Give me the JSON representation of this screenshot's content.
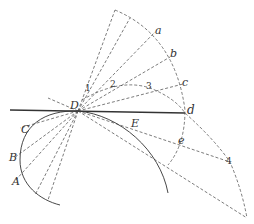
{
  "diagram": {
    "type": "geometric construction",
    "labels": {
      "D": "D",
      "E": "E",
      "C": "C",
      "B": "B",
      "A": "A",
      "a": "a",
      "b": "b",
      "c": "c",
      "d": "d",
      "e": "e"
    },
    "numbers": {
      "n1": "1",
      "n2": "2",
      "n3": "3",
      "n4": "4"
    },
    "colors": {
      "line": "#333333",
      "background": "#ffffff"
    }
  }
}
